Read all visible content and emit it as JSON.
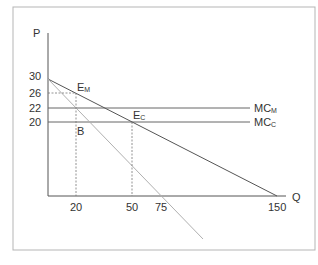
{
  "diagram": {
    "axes": {
      "y_label": "P",
      "x_label": "Q"
    },
    "y_ticks": [
      "30",
      "26",
      "22",
      "20"
    ],
    "x_ticks": [
      "20",
      "50",
      "75",
      "150"
    ],
    "points": {
      "monopoly_eq": {
        "main": "E",
        "sub": "M"
      },
      "competitive_eq": {
        "main": "E",
        "sub": "C"
      },
      "b": "B"
    },
    "curves": {
      "mc_monopoly": {
        "main": "MC",
        "sub": "M"
      },
      "mc_competitive": {
        "main": "MC",
        "sub": "C"
      }
    },
    "colors": {
      "border": "#b5b5b5",
      "axis": "#555555",
      "demand": "#555555",
      "mr": "#b0b0b0",
      "mc": "#666666",
      "dashed": "#777777",
      "text": "#333333"
    }
  }
}
